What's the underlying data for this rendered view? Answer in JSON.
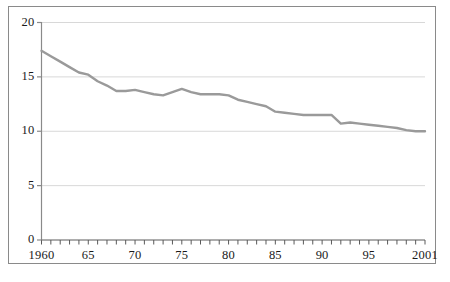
{
  "chart_data": {
    "type": "line",
    "title": "",
    "subtitle": "",
    "xlabel": "",
    "ylabel": "",
    "xlim": [
      1960,
      2001
    ],
    "ylim": [
      0,
      20
    ],
    "grid": true,
    "legend": null,
    "series_color": "#9a9a9a",
    "axis_color": "#8a8a8a",
    "grid_color": "#d8d8d8",
    "x_tick_labels": [
      "1960",
      "65",
      "70",
      "75",
      "80",
      "85",
      "90",
      "95",
      "2001"
    ],
    "x_tick_values": [
      1960,
      1965,
      1970,
      1975,
      1980,
      1985,
      1990,
      1995,
      2001
    ],
    "y_tick_labels": [
      "0",
      "5",
      "10",
      "15",
      "20"
    ],
    "y_tick_values": [
      0,
      5,
      10,
      15,
      20
    ],
    "minor_x_ticks_every": 1,
    "x": [
      1960,
      1961,
      1962,
      1963,
      1964,
      1965,
      1966,
      1967,
      1968,
      1969,
      1970,
      1971,
      1972,
      1973,
      1974,
      1975,
      1976,
      1977,
      1978,
      1979,
      1980,
      1981,
      1982,
      1983,
      1984,
      1985,
      1986,
      1987,
      1988,
      1989,
      1990,
      1991,
      1992,
      1993,
      1994,
      1995,
      1996,
      1997,
      1998,
      1999,
      2000,
      2001
    ],
    "series": [
      {
        "name": "rate",
        "values": [
          17.4,
          16.9,
          16.4,
          15.9,
          15.4,
          15.2,
          14.6,
          14.2,
          13.7,
          13.7,
          13.8,
          13.6,
          13.4,
          13.3,
          13.6,
          13.9,
          13.6,
          13.4,
          13.4,
          13.4,
          13.3,
          12.9,
          12.7,
          12.5,
          12.3,
          11.8,
          11.7,
          11.6,
          11.5,
          11.5,
          11.5,
          11.5,
          10.7,
          10.8,
          10.7,
          10.6,
          10.5,
          10.4,
          10.3,
          10.1,
          10.0,
          10.0
        ]
      }
    ]
  }
}
